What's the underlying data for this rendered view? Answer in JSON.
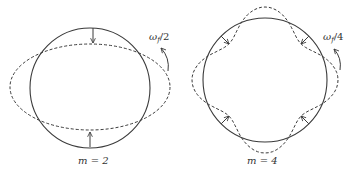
{
  "figure": {
    "colors": {
      "line": "#3a3a3a",
      "background": "#ffffff"
    },
    "panels": [
      {
        "id": "m2",
        "mode_label": "m = 2",
        "rotation_label_base": "ω",
        "rotation_label_sub": "f",
        "rotation_label_tail": "/2",
        "circle": {
          "cx": 90,
          "cy": 88,
          "r": 60
        },
        "perturbed_shape": "ellipse (dashed)",
        "arrows": "inward at top and bottom"
      },
      {
        "id": "m4",
        "mode_label": "m = 4",
        "rotation_label_base": "ω",
        "rotation_label_sub": "f",
        "rotation_label_tail": "/4",
        "circle": {
          "cx": 265,
          "cy": 80,
          "r": 62
        },
        "perturbed_shape": "four-lobed (dashed)",
        "arrows": "inward at four diagonals"
      }
    ]
  }
}
